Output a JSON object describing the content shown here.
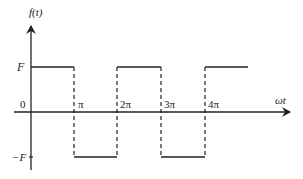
{
  "diagram": {
    "y_axis_label": "f(t)",
    "x_axis_label": "ωt",
    "origin_label": "0",
    "level_high_label": "F",
    "level_low_label": "−F",
    "tick_labels": [
      "π",
      "2π",
      "3π",
      "4π"
    ],
    "colors": {
      "line": "#222222",
      "background": "#ffffff"
    }
  }
}
